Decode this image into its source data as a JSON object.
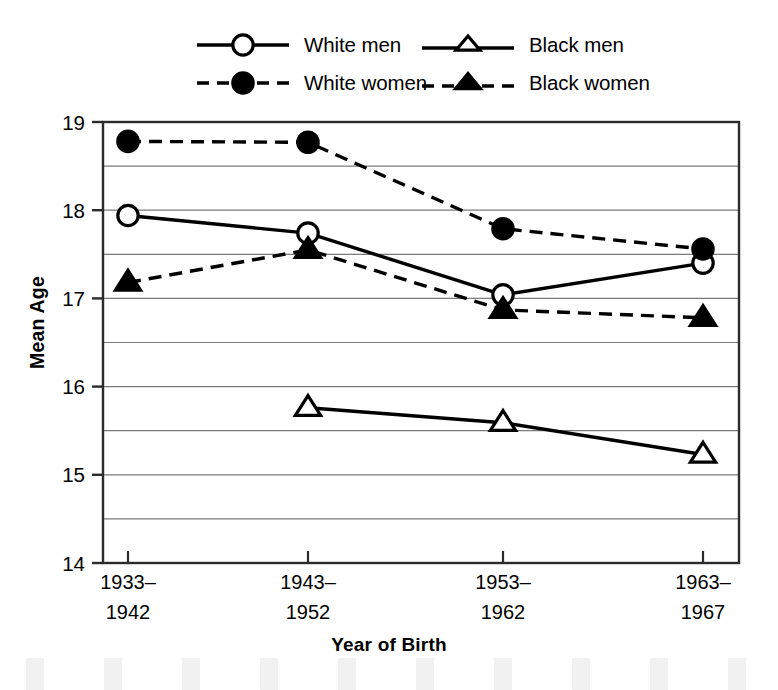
{
  "chart_data": {
    "type": "line",
    "title": "",
    "xlabel": "Year of Birth",
    "ylabel": "Mean Age",
    "categories": [
      "1933–\n1942",
      "1943–\n1952",
      "1953–\n1962",
      "1963–\n1967"
    ],
    "category_lines": [
      [
        "1933–",
        "1942"
      ],
      [
        "1943–",
        "1952"
      ],
      [
        "1953–",
        "1962"
      ],
      [
        "1963–",
        "1967"
      ]
    ],
    "ylim": [
      14,
      19
    ],
    "ytick_labels": [
      "14",
      "15",
      "16",
      "17",
      "18",
      "19"
    ],
    "ytick_values": [
      14,
      15,
      16,
      17,
      18,
      19
    ],
    "gridline_values": [
      14.5,
      15,
      15.5,
      16,
      16.5,
      17,
      17.5,
      18,
      18.5
    ],
    "grid": true,
    "legend_position": "top",
    "series": [
      {
        "name": "White men",
        "marker": "open-circle",
        "line": "solid",
        "color": "#000000",
        "x": [
          "1933–1942",
          "1943–1952",
          "1953–1962",
          "1963–1967"
        ],
        "values": [
          17.94,
          17.74,
          17.04,
          17.4
        ]
      },
      {
        "name": "White women",
        "marker": "filled-circle",
        "line": "dashed",
        "color": "#000000",
        "x": [
          "1933–1942",
          "1943–1952",
          "1953–1962",
          "1963–1967"
        ],
        "values": [
          18.78,
          18.77,
          17.79,
          17.56
        ]
      },
      {
        "name": "Black men",
        "marker": "open-triangle",
        "line": "solid",
        "color": "#000000",
        "x": [
          "1943–1952",
          "1953–1962",
          "1963–1967"
        ],
        "values": [
          15.76,
          15.59,
          15.23
        ]
      },
      {
        "name": "Black women",
        "marker": "filled-triangle",
        "line": "dashed",
        "color": "#000000",
        "x": [
          "1933–1942",
          "1943–1952",
          "1953–1962",
          "1963–1967"
        ],
        "values": [
          17.18,
          17.55,
          16.87,
          16.78
        ]
      }
    ]
  },
  "legend": {
    "entries": [
      {
        "label": "White men",
        "marker": "open-circle",
        "line": "solid"
      },
      {
        "label": "White women",
        "marker": "filled-circle",
        "line": "dashed"
      },
      {
        "label": "Black men",
        "marker": "open-triangle",
        "line": "solid"
      },
      {
        "label": "Black women",
        "marker": "filled-triangle",
        "line": "dashed"
      }
    ]
  },
  "axes": {
    "x_title": "Year of Birth",
    "y_title": "Mean Age"
  },
  "colors": {
    "ink": "#000000",
    "grid": "#7a7a7a",
    "frame": "#2b2b2b",
    "background": "#ffffff"
  }
}
